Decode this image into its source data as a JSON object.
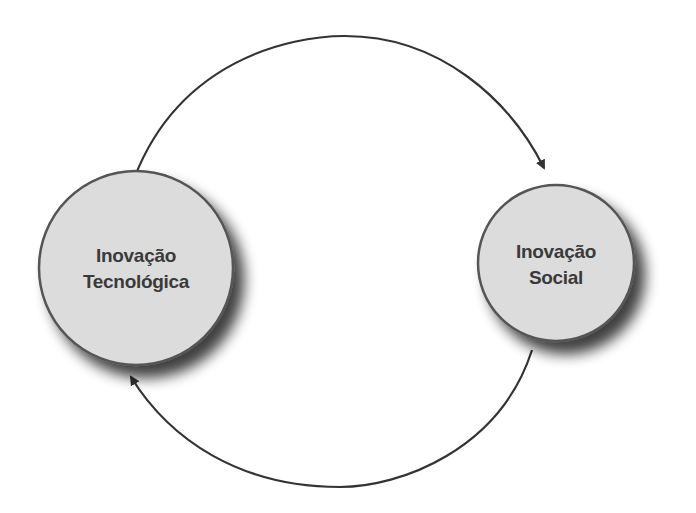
{
  "diagram": {
    "type": "cycle",
    "nodes": [
      {
        "id": "tecnologica",
        "lines": [
          "Inovação",
          "Tecnológica"
        ],
        "cx": 136,
        "cy": 268,
        "r": 97
      },
      {
        "id": "social",
        "lines": [
          "Inovação",
          "Social"
        ],
        "cx": 556,
        "cy": 263,
        "r": 78
      }
    ],
    "edges": [
      {
        "from": "tecnologica",
        "to": "social",
        "position": "top"
      },
      {
        "from": "social",
        "to": "tecnologica",
        "position": "bottom"
      }
    ],
    "colors": {
      "node_fill": "#dcdcdc",
      "node_stroke": "#555555",
      "arrow": "#333333",
      "text": "#3a3a3a"
    }
  }
}
